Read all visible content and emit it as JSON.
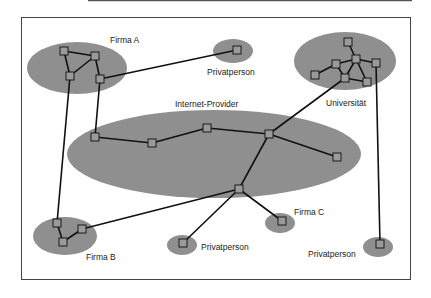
{
  "diagram": {
    "type": "network-topology",
    "colors": {
      "cluster_fill": "#8f8f8f",
      "node_fill": "#9a9a9a",
      "edge": "#111111",
      "frame": "#444444",
      "text": "#222222"
    },
    "labels": {
      "firma_a": "Firma A",
      "privatperson_top": "Privatperson",
      "universitaet": "Universität",
      "internet_provider": "Internet-Provider",
      "firma_b": "Firma B",
      "privatperson_bottom": "Privatperson",
      "firma_c": "Firma C",
      "privatperson_right": "Privatperson"
    },
    "clusters": [
      {
        "id": "firma_a",
        "label": "Firma A",
        "node_count": 4
      },
      {
        "id": "privatperson_top",
        "label": "Privatperson",
        "node_count": 1
      },
      {
        "id": "universitaet",
        "label": "Universität",
        "node_count": 7
      },
      {
        "id": "internet_provider",
        "label": "Internet-Provider",
        "node_count": 6
      },
      {
        "id": "firma_b",
        "label": "Firma B",
        "node_count": 3
      },
      {
        "id": "privatperson_bottom",
        "label": "Privatperson",
        "node_count": 1
      },
      {
        "id": "firma_c",
        "label": "Firma C",
        "node_count": 1
      },
      {
        "id": "privatperson_right",
        "label": "Privatperson",
        "node_count": 1
      }
    ],
    "connections": [
      {
        "from": "Firma A",
        "to": "Privatperson (top)"
      },
      {
        "from": "Firma A",
        "to": "Internet-Provider"
      },
      {
        "from": "Firma A",
        "to": "Firma B"
      },
      {
        "from": "Universität",
        "to": "Internet-Provider"
      },
      {
        "from": "Universität",
        "to": "Privatperson (right)"
      },
      {
        "from": "Internet-Provider",
        "to": "Firma B"
      },
      {
        "from": "Internet-Provider",
        "to": "Privatperson (bottom)"
      },
      {
        "from": "Internet-Provider",
        "to": "Firma C"
      }
    ]
  }
}
